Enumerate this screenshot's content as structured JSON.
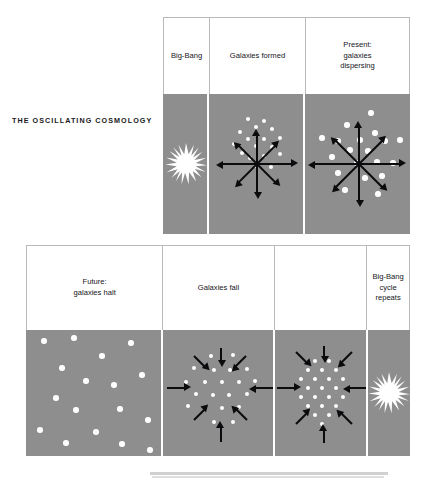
{
  "figure": {
    "title": "THE  OSCILLATING  COSMOLOGY",
    "panel_bg_color": "#8e8e8e",
    "galaxy_color": "#fdfdfd",
    "arrow_color": "#0b0b0d",
    "frame_color": "#b9b9bc"
  },
  "rows": [
    {
      "name": "expansion-row",
      "panels": [
        {
          "caption": "Big-Bang",
          "content": "starburst",
          "arrows": [],
          "galaxies": []
        },
        {
          "caption": "Galaxies formed",
          "content": "galaxy-cluster",
          "arrow_direction": "outward",
          "arrow_count": 8,
          "galaxy_count": 17,
          "cluster_spread": "tight"
        },
        {
          "caption": "Present:\ngalaxies\ndispersing",
          "content": "galaxy-cluster",
          "arrow_direction": "outward",
          "arrow_count": 8,
          "galaxy_count": 19,
          "cluster_spread": "wide"
        }
      ]
    },
    {
      "name": "contraction-row",
      "panels": [
        {
          "caption": "Future:\ngalaxies halt",
          "content": "galaxy-scatter",
          "arrow_direction": "none",
          "arrow_count": 0,
          "galaxy_count": 17,
          "cluster_spread": "dispersed"
        },
        {
          "caption": "Galaxies fall",
          "content": "galaxy-cluster",
          "arrow_direction": "inward",
          "arrow_count": 8,
          "galaxy_count": 21,
          "cluster_spread": "medium"
        },
        {
          "caption": "",
          "content": "galaxy-cluster",
          "arrow_direction": "inward",
          "arrow_count": 8,
          "galaxy_count": 22,
          "cluster_spread": "tight"
        },
        {
          "caption": "Big-Bang\ncycle\nrepeats",
          "content": "starburst",
          "arrows": [],
          "galaxies": []
        }
      ]
    }
  ]
}
